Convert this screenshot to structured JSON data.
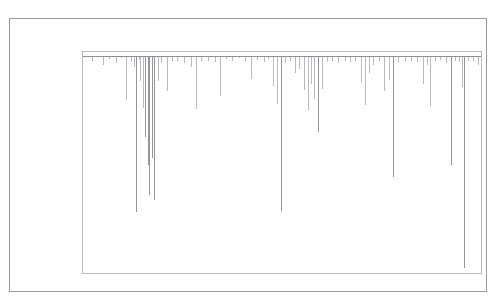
{
  "figure": {
    "title": "FIGURE 1: MAXIMUM DRAWDOWN OF THE S&P 500 INDEX",
    "frame_color": "#9a9a9a",
    "axes_color": "#b9b9b9",
    "series_color": "#8e8e96",
    "background": "#ffffff"
  },
  "chart_data": {
    "type": "line",
    "title": "FIGURE 1: MAXIMUM DRAWDOWN OF THE S&P 500 INDEX",
    "subtitle": "",
    "xlabel": "",
    "ylabel": "",
    "xlim": [
      1974.0,
      2022.5
    ],
    "ylim": [
      0.725,
      1.005
    ],
    "xticks": [
      1980,
      1990,
      2000,
      2010,
      2020
    ],
    "xtick_labels": [
      "1980",
      "1990",
      "2000",
      "2010",
      "2020"
    ],
    "yticks": [
      0.75,
      0.8,
      0.85,
      0.9,
      0.95,
      1.0
    ],
    "ytick_labels": [
      "0.75",
      "0.80",
      "0.85",
      "0.90",
      "0.95",
      "1.00"
    ],
    "grid": false,
    "legend": null,
    "legend_position": "none",
    "baseline": 1.0,
    "series": [
      {
        "name": "Drawdown",
        "color": "#8e8e96",
        "x": [
          1975.1,
          1976.4,
          1977.2,
          1978.0,
          1978.6,
          1979.3,
          1979.9,
          1980.2,
          1980.5,
          1980.8,
          1981.0,
          1981.3,
          1981.6,
          1981.9,
          1982.1,
          1982.4,
          1982.7,
          1983.1,
          1983.5,
          1984.2,
          1984.8,
          1985.5,
          1986.3,
          1987.1,
          1987.8,
          1988.4,
          1989.2,
          1990.1,
          1990.7,
          1991.4,
          1992.2,
          1993.0,
          1993.8,
          1994.5,
          1995.2,
          1996.0,
          1996.6,
          1997.2,
          1997.7,
          1998.1,
          1998.6,
          1999.2,
          1999.8,
          2000.3,
          2000.9,
          2001.4,
          2001.8,
          2002.2,
          2002.6,
          2003.1,
          2003.7,
          2004.4,
          2005.1,
          2005.9,
          2006.5,
          2007.2,
          2007.9,
          2008.4,
          2008.9,
          2009.3,
          2010.1,
          2010.7,
          2011.3,
          2011.8,
          2012.4,
          2013.2,
          2014.0,
          2014.7,
          2015.4,
          2015.9,
          2016.3,
          2016.9,
          2017.5,
          2018.2,
          2018.8,
          2019.3,
          2019.8,
          2020.15,
          2020.4,
          2020.9,
          2021.5,
          2022.1
        ],
        "y": [
          0.993,
          0.988,
          0.996,
          0.991,
          0.997,
          0.944,
          0.992,
          0.986,
          0.802,
          0.995,
          0.968,
          0.934,
          0.897,
          0.862,
          0.824,
          0.871,
          0.818,
          0.968,
          0.991,
          0.955,
          0.993,
          0.994,
          0.991,
          0.986,
          0.933,
          0.994,
          0.993,
          0.992,
          0.949,
          0.996,
          0.994,
          0.997,
          0.993,
          0.971,
          0.995,
          0.992,
          0.996,
          0.962,
          0.939,
          0.803,
          0.991,
          0.994,
          0.978,
          0.983,
          0.957,
          0.931,
          0.964,
          0.946,
          0.903,
          0.958,
          0.992,
          0.993,
          0.991,
          0.994,
          0.992,
          0.993,
          0.967,
          0.938,
          0.979,
          0.988,
          0.993,
          0.955,
          0.969,
          0.847,
          0.991,
          0.994,
          0.993,
          0.992,
          0.964,
          0.988,
          0.937,
          0.993,
          0.995,
          0.991,
          0.862,
          0.994,
          0.992,
          0.961,
          0.731,
          0.993,
          0.994,
          0.989
        ]
      }
    ],
    "notable_drawdowns": [
      {
        "year": 1980.5,
        "value": 0.802,
        "event": "1980 drawdown"
      },
      {
        "year": 1982.1,
        "value": 0.824,
        "event": "1981-82 bear market"
      },
      {
        "year": 1982.7,
        "value": 0.818,
        "event": "1982 trough"
      },
      {
        "year": 1987.8,
        "value": 0.933,
        "event": "1987 crash"
      },
      {
        "year": 1998.1,
        "value": 0.803,
        "event": "1998 LTCM / Asia crisis"
      },
      {
        "year": 2002.6,
        "value": 0.903,
        "event": "Dot-com bust"
      },
      {
        "year": 2008.4,
        "value": 0.938,
        "event": "Global financial crisis"
      },
      {
        "year": 2011.8,
        "value": 0.847,
        "event": "2011 debt-ceiling selloff"
      },
      {
        "year": 2018.8,
        "value": 0.862,
        "event": "Q4 2018 selloff"
      },
      {
        "year": 2020.4,
        "value": 0.731,
        "event": "COVID-19 crash"
      }
    ]
  }
}
